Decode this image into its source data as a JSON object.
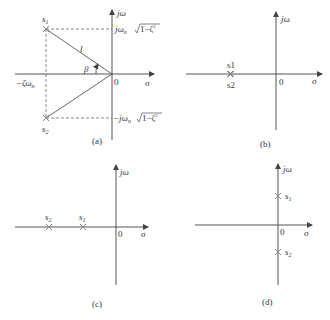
{
  "panels": {
    "a": {
      "caption": "(a)",
      "axis_x_label": "σ",
      "axis_y_label": "jω",
      "origin_label": "0",
      "s1_label": "s",
      "s1_sub": "1",
      "s2_label": "s",
      "s2_sub": "2",
      "real_part_label": "−ζω",
      "real_part_sub": "n",
      "upper_imag_label": "jω",
      "upper_imag_sub": "n",
      "upper_imag_sqrt": "1−ζ",
      "lower_imag_label": "−jω",
      "lower_imag_sub": "n",
      "lower_imag_sqrt": "1−ζ",
      "sq": "2",
      "length_label": "l",
      "angle_label": "β"
    },
    "b": {
      "caption": "(b)",
      "axis_x_label": "σ",
      "axis_y_label": "jω",
      "origin_label": "0",
      "s1_label": "s1",
      "s2_label": "s2"
    },
    "c": {
      "caption": "(c)",
      "axis_x_label": "σ",
      "axis_y_label": "jω",
      "origin_label": "0",
      "s1_label": "s",
      "s1_sub": "1",
      "s2_label": "s",
      "s2_sub": "2"
    },
    "d": {
      "caption": "(d)",
      "axis_x_label": "σ",
      "axis_y_label": "jω",
      "origin_label": "0",
      "s1_label": "s",
      "s1_sub": "1",
      "s2_label": "s",
      "s2_sub": "2"
    }
  }
}
